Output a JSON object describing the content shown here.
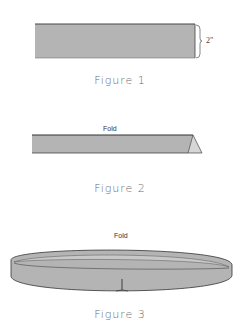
{
  "figures": [
    {
      "caption": "Figure 1",
      "dimension_label": "2\""
    },
    {
      "caption": "Figure 2",
      "fold_label": "Fold"
    },
    {
      "caption": "Figure 3",
      "fold_label": "Fold"
    }
  ],
  "colors": {
    "strip_fill": "#b4b4b4",
    "strip_edge": "#555555",
    "inner_fill": "#d6d6d6",
    "caption": "#6a6a6a"
  }
}
